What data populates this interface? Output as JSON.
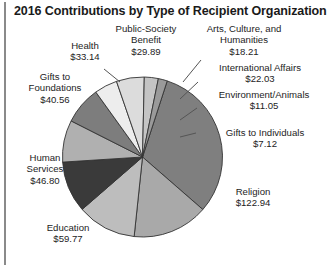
{
  "chart_title": "2016 Contributions by Type of Recipient Organization",
  "chart_data": {
    "type": "pie",
    "title": "2016 Contributions by Type of Recipient Organization",
    "unit": "$ billions",
    "total": 391.51,
    "legend": "none",
    "grid": false,
    "categories": [
      "Religion",
      "Education",
      "Human Services",
      "Gifts to Foundations",
      "Health",
      "Public-Society Benefit",
      "Arts, Culture, and Humanities",
      "International Affairs",
      "Environment/Animals",
      "Gifts to Individuals"
    ],
    "values": [
      122.94,
      59.77,
      46.8,
      40.56,
      33.14,
      29.89,
      18.21,
      22.03,
      11.05,
      7.12
    ],
    "value_labels": [
      "$122.94",
      "$59.77",
      "$46.80",
      "$40.56",
      "$33.14",
      "$29.89",
      "$18.21",
      "$22.03",
      "$11.05",
      "$7.12"
    ],
    "slice_colors": [
      "#7f7f7f",
      "#a9a9a9",
      "#bdbdbd",
      "#3a3a3a",
      "#b0b0b0",
      "#7d7d7d",
      "#ededed",
      "#dcdcdc",
      "#c4c4c4",
      "#9a9a9a"
    ]
  },
  "labels": {
    "religion": {
      "name": "Religion",
      "value": "$122.94"
    },
    "education": {
      "name": "Education",
      "value": "$59.77"
    },
    "human_services_l1": "Human",
    "human_services_l2": "Services",
    "human_services_value": "$46.80",
    "gifts_to_foundations_l1": "Gifts to",
    "gifts_to_foundations_l2": "Foundations",
    "gifts_to_foundations_value": "$40.56",
    "health": {
      "name": "Health",
      "value": "$33.14"
    },
    "public_society_l1": "Public-Society",
    "public_society_l2": "Benefit",
    "public_society_value": "$29.89",
    "arts_l1": "Arts, Culture, and",
    "arts_l2": "Humanities",
    "arts_value": "$18.21",
    "international": {
      "name": "International Affairs",
      "value": "$22.03"
    },
    "environment": {
      "name": "Environment/Animals",
      "value": "$11.05"
    },
    "gifts_individuals": {
      "name": "Gifts to Individuals",
      "value": "$7.12"
    }
  },
  "colors": {
    "outline": "#333333",
    "leader": "#555555",
    "frame": "#8a8a8a",
    "text": "#1d1d1d"
  }
}
